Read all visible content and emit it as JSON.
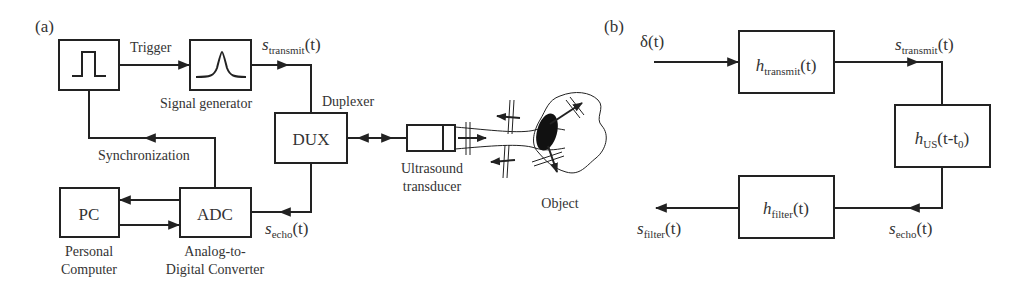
{
  "panel_a": {
    "tag": "(a)",
    "trigger_label": "Trigger",
    "signal_generator_label": "Signal generator",
    "s_transmit": {
      "base": "s",
      "sub": "transmit",
      "arg": "(t)"
    },
    "duplexer_label": "Duplexer",
    "dux_label": "DUX",
    "synchronization_label": "Synchronization",
    "pc_label": "PC",
    "pc_caption": [
      "Personal",
      "Computer"
    ],
    "adc_label": "ADC",
    "adc_caption": [
      "Analog-to-",
      "Digital Converter"
    ],
    "s_echo": {
      "base": "s",
      "sub": "echo",
      "arg": "(t)"
    },
    "transducer_caption": [
      "Ultrasound",
      "transducer"
    ],
    "object_caption": "Object"
  },
  "panel_b": {
    "tag": "(b)",
    "input": "δ(t)",
    "h_transmit": {
      "base": "h",
      "sub": "transmit",
      "arg": "(t)"
    },
    "s_transmit": {
      "base": "s",
      "sub": "transmit",
      "arg": "(t)"
    },
    "h_us": {
      "base": "h",
      "sub": "US",
      "arg": "(t-t",
      "sub2": "0",
      "close": ")"
    },
    "s_echo": {
      "base": "s",
      "sub": "echo",
      "arg": "(t)"
    },
    "h_filter": {
      "base": "h",
      "sub": "filter",
      "arg": "(t)"
    },
    "s_filter": {
      "base": "s",
      "sub": "filter",
      "arg": "(t)"
    }
  }
}
